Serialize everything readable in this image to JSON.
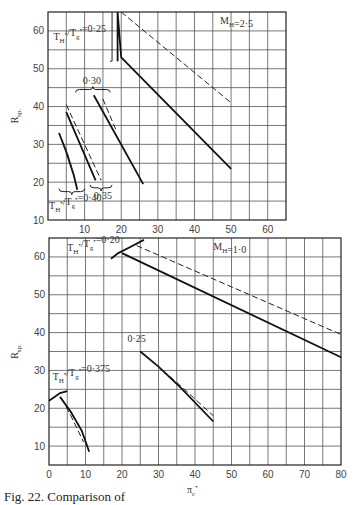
{
  "caption": "Fig. 22. Comparison of",
  "chart_data": [
    {
      "type": "line",
      "title": "",
      "annotation": "M_H=2·5",
      "xlabel": "",
      "ylabel": "R_sp.",
      "xlim": [
        0,
        65
      ],
      "ylim": [
        10,
        65
      ],
      "xticks": [
        10,
        20,
        30,
        40,
        50,
        60
      ],
      "yticks": [
        10,
        20,
        30,
        40,
        50,
        60
      ],
      "grid": true,
      "box": {
        "x0": 48,
        "x1": 286,
        "y0": 12,
        "y1": 220
      },
      "labels": [
        {
          "text": "T_H*/T_g*=0·25",
          "x": 1.5,
          "y": 57.5
        },
        {
          "text": "0·30",
          "x": 9.5,
          "y": 46
        },
        {
          "text": "0·35",
          "x": 12.5,
          "y": 15.5
        },
        {
          "text": "T_H*/T_g*=0·40",
          "x": 0.3,
          "y": 12.8
        }
      ],
      "series": [
        {
          "name": "T_H*/T_g*=0·25 (solid)",
          "style": "solid",
          "x": [
            19,
            19,
            20,
            50
          ],
          "y": [
            52,
            65,
            53,
            23.5
          ]
        },
        {
          "name": "T_H*/T_g*=0·25 (dashed)",
          "style": "dashed",
          "x": [
            20,
            50
          ],
          "y": [
            65,
            41
          ]
        },
        {
          "name": "T_H*/T_g*=0·30 (solid)",
          "style": "solid",
          "x": [
            12.5,
            26
          ],
          "y": [
            43,
            19.5
          ]
        },
        {
          "name": "T_H*/T_g*=0·30 (dashed)",
          "style": "dashed",
          "x": [
            15,
            18.5
          ],
          "y": [
            42,
            34
          ]
        },
        {
          "name": "T_H*/T_g*=0·35 (solid)",
          "style": "solid",
          "x": [
            5,
            13
          ],
          "y": [
            38.5,
            20.5
          ]
        },
        {
          "name": "T_H*/T_g*=0·35 (dashed)",
          "style": "dashed",
          "x": [
            5,
            14.5
          ],
          "y": [
            40.5,
            20.5
          ]
        },
        {
          "name": "T_H*/T_g*=0·40 (solid)",
          "style": "solid",
          "x": [
            3,
            5,
            7,
            8
          ],
          "y": [
            33,
            28,
            22,
            18
          ]
        },
        {
          "name": "T_H*/T_g*=0·40 (dashed)",
          "style": "dashed",
          "x": [
            3.5,
            5.5,
            7
          ],
          "y": [
            32,
            27,
            22
          ]
        }
      ],
      "braces": [
        {
          "x1": 16.5,
          "x2": 17.5,
          "y": 62,
          "vertical": true
        },
        {
          "x1": 7.5,
          "x2": 17,
          "y": 44.5
        },
        {
          "x1": 11.5,
          "x2": 17.5,
          "y": 18.5,
          "down": true
        },
        {
          "x1": 3,
          "x2": 10,
          "y": 17.5,
          "down": true
        }
      ]
    },
    {
      "type": "line",
      "title": "",
      "annotation": "M_H=1·0",
      "xlabel": "π_c*",
      "ylabel": "R_sp.",
      "xlim": [
        0,
        80
      ],
      "ylim": [
        5,
        65
      ],
      "xticks": [
        0,
        10,
        20,
        30,
        40,
        50,
        60,
        70,
        80
      ],
      "yticks": [
        10,
        20,
        30,
        40,
        50,
        60
      ],
      "grid": true,
      "box": {
        "x0": 49,
        "x1": 341,
        "y0": 238,
        "y1": 465
      },
      "labels": [
        {
          "text": "T_H*/T_g*=0·20",
          "x": 5,
          "y": 61.5
        },
        {
          "text": "0·25",
          "x": 21.5,
          "y": 37.5
        },
        {
          "text": "T_H*/T_g*=0·375",
          "x": 1,
          "y": 27.5
        }
      ],
      "series": [
        {
          "name": "T_H*/T_g*=0·20 (solid)",
          "style": "solid",
          "x": [
            20,
            80
          ],
          "y": [
            61,
            33.5
          ]
        },
        {
          "name": "T_H*/T_g*=0·20 (dashed)",
          "style": "dashed",
          "x": [
            24,
            80
          ],
          "y": [
            63,
            39.5
          ]
        },
        {
          "name": "T_H*/T_g*=0·20 (envelope)",
          "style": "solid",
          "x": [
            17,
            19,
            22,
            26
          ],
          "y": [
            59.5,
            61,
            62.5,
            64.5
          ]
        },
        {
          "name": "T_H*/T_g*=0·25 (solid)",
          "style": "solid",
          "x": [
            25,
            30,
            36,
            45
          ],
          "y": [
            35,
            31,
            25.5,
            16.5
          ]
        },
        {
          "name": "T_H*/T_g*=0·25 (dashed)",
          "style": "dashed",
          "x": [
            25.5,
            30,
            36,
            45
          ],
          "y": [
            34.5,
            31,
            26,
            18
          ]
        },
        {
          "name": "T_H*/T_g*=0·375 (solid)",
          "style": "solid",
          "x": [
            3,
            6,
            9,
            11
          ],
          "y": [
            23,
            19,
            14,
            8.5
          ]
        },
        {
          "name": "T_H*/T_g*=0·375 (dashed)",
          "style": "dashed",
          "x": [
            3.5,
            6,
            8,
            9.5
          ],
          "y": [
            22.5,
            18,
            14,
            11
          ]
        },
        {
          "name": "T_H*/T_g*=0·375 (envelope)",
          "style": "solid",
          "x": [
            0,
            1.5,
            3,
            5
          ],
          "y": [
            22,
            23,
            24,
            24.5
          ]
        }
      ]
    }
  ]
}
